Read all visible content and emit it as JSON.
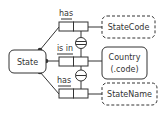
{
  "diagram": {
    "type": "ORM",
    "entities": [
      {
        "id": "state",
        "label": "State",
        "style": "solid"
      },
      {
        "id": "statecode",
        "label": "StateCode",
        "style": "dashed"
      },
      {
        "id": "country",
        "label_line1": "Country",
        "label_line2": "(.code)",
        "style": "solid"
      },
      {
        "id": "statename",
        "label": "StateName",
        "style": "dashed"
      }
    ],
    "fact_types": [
      {
        "reading": "has",
        "from": "State",
        "to": "StateCode"
      },
      {
        "reading": "is in",
        "from": "State",
        "to": "Country"
      },
      {
        "reading": "has",
        "from": "State",
        "to": "StateName"
      }
    ],
    "constraints": [
      {
        "type": "external-uniqueness",
        "between": [
          "has StateCode",
          "is in Country"
        ]
      },
      {
        "type": "external-uniqueness",
        "between": [
          "is in Country",
          "has StateName"
        ]
      }
    ],
    "colors": {
      "stroke": "#333333",
      "background": "#ffffff"
    }
  }
}
